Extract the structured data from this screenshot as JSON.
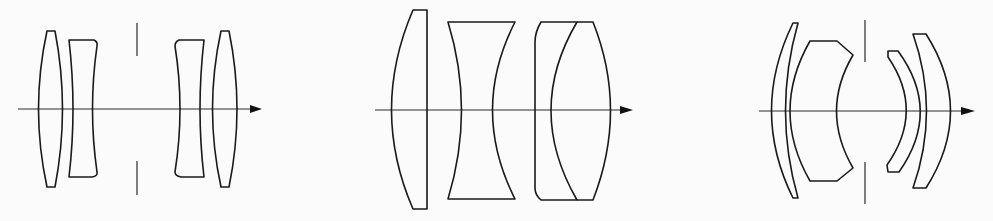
{
  "figure": {
    "type": "optical lens cross-section diagrams",
    "stroke_color": "#1a1a1a",
    "background_color": "#fbfbfb",
    "panels": [
      {
        "id": "panel-1",
        "description": "Symmetric four-element lens (double-Gauss / Dagor-like separated) with central aperture stop",
        "elements": [
          {
            "name": "front-biconvex-lens",
            "shape": "biconvex"
          },
          {
            "name": "front-biconcave-lens",
            "shape": "biconcave"
          },
          {
            "name": "aperture-stop",
            "shape": "stop"
          },
          {
            "name": "rear-biconcave-lens",
            "shape": "biconcave"
          },
          {
            "name": "rear-biconvex-lens",
            "shape": "biconvex"
          }
        ],
        "optical_axis": "arrow pointing right"
      },
      {
        "id": "panel-2",
        "description": "Three-group lens: plano-convex, biconcave, cemented doublet (Tessar-like)",
        "elements": [
          {
            "name": "plano-convex-lens",
            "shape": "plano-convex"
          },
          {
            "name": "biconcave-lens",
            "shape": "biconcave"
          },
          {
            "name": "cemented-doublet",
            "shape": "cemented doublet"
          }
        ],
        "optical_axis": "arrow pointing right"
      },
      {
        "id": "panel-3",
        "description": "Meniscus-element lens with central aperture stop",
        "elements": [
          {
            "name": "front-thin-meniscus-lens",
            "shape": "meniscus"
          },
          {
            "name": "front-thick-meniscus-lens",
            "shape": "thick meniscus"
          },
          {
            "name": "aperture-stop",
            "shape": "stop"
          },
          {
            "name": "rear-thin-meniscus-lens",
            "shape": "meniscus"
          },
          {
            "name": "rear-thick-meniscus-lens",
            "shape": "meniscus"
          }
        ],
        "optical_axis": "arrow pointing right"
      }
    ]
  }
}
